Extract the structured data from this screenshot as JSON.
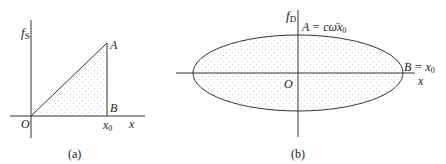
{
  "panel_a": {
    "y_axis_label": "f",
    "y_axis_sub": "S",
    "x_axis_label": "x",
    "origin_label": "O",
    "point_a": "A",
    "point_b": "B",
    "x0_label": "x",
    "x0_sub": "0",
    "caption": "(a)"
  },
  "panel_b": {
    "y_axis_label": "f",
    "y_axis_sub": "D",
    "x_axis_label": "x",
    "origin_label": "O",
    "point_a_label": "A = c",
    "point_a_omega": "ω̄",
    "point_a_x": "x",
    "point_a_sub": "0",
    "point_b_label": "B = x",
    "point_b_sub": "0",
    "caption": "(b)"
  },
  "colors": {
    "line": "#333333",
    "fill_dots": "#9a9a9a"
  }
}
